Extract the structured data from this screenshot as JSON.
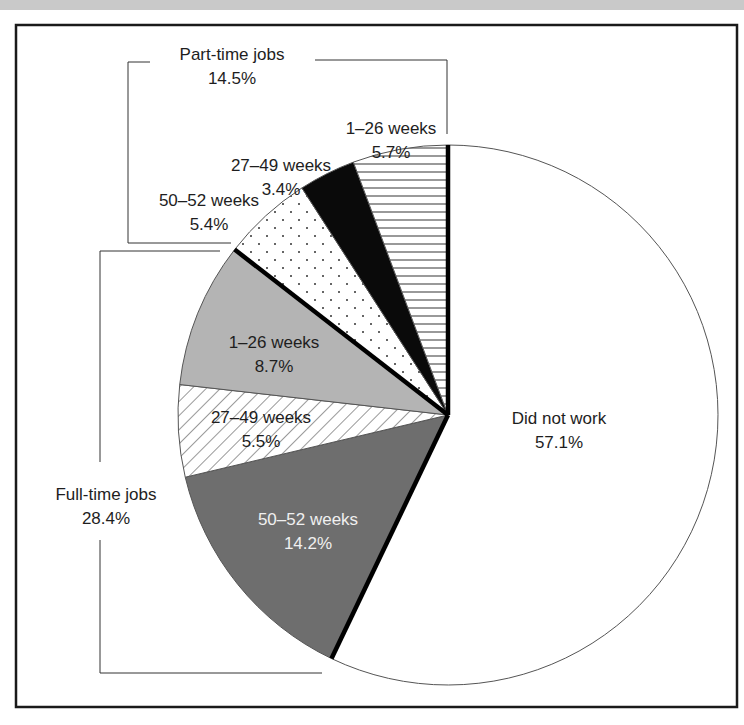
{
  "chart_data": {
    "type": "pie",
    "title": "",
    "start_angle_deg": 0,
    "direction": "clockwise",
    "slices": [
      {
        "id": "did_not_work",
        "group": "Did not work",
        "label": "Did not work",
        "value": 57.1,
        "value_label": "57.1%",
        "fill": "#ffffff",
        "pattern": "none"
      },
      {
        "id": "ft_50_52",
        "group": "Full-time jobs",
        "label": "50–52 weeks",
        "value": 14.2,
        "value_label": "14.2%",
        "fill": "#6e6e6e",
        "pattern": "solid"
      },
      {
        "id": "ft_27_49",
        "group": "Full-time jobs",
        "label": "27–49 weeks",
        "value": 5.5,
        "value_label": "5.5%",
        "fill": "#ffffff",
        "pattern": "diagonal-hatch"
      },
      {
        "id": "ft_1_26",
        "group": "Full-time jobs",
        "label": "1–26 weeks",
        "value": 8.7,
        "value_label": "8.7%",
        "fill": "#b4b4b4",
        "pattern": "solid"
      },
      {
        "id": "pt_50_52",
        "group": "Part-time jobs",
        "label": "50–52 weeks",
        "value": 5.4,
        "value_label": "5.4%",
        "fill": "#ffffff",
        "pattern": "dots"
      },
      {
        "id": "pt_27_49",
        "group": "Part-time jobs",
        "label": "27–49 weeks",
        "value": 3.4,
        "value_label": "3.4%",
        "fill": "#0a0a0a",
        "pattern": "solid"
      },
      {
        "id": "pt_1_26",
        "group": "Part-time jobs",
        "label": "1–26 weeks",
        "value": 5.7,
        "value_label": "5.7%",
        "fill": "#ffffff",
        "pattern": "horizontal-hatch"
      }
    ],
    "groups": [
      {
        "name": "Part-time jobs",
        "total_label": "14.5%",
        "value": 14.5
      },
      {
        "name": "Full-time jobs",
        "total_label": "28.4%",
        "value": 28.4
      }
    ],
    "legend": "none (direct labels with brackets)"
  },
  "labels": {
    "part_time": {
      "title": "Part-time jobs",
      "pct": "14.5%"
    },
    "full_time": {
      "title": "Full-time jobs",
      "pct": "28.4%"
    },
    "pt_1_26": {
      "name": "1–26 weeks",
      "pct": "5.7%"
    },
    "pt_27_49": {
      "name": "27–49 weeks",
      "pct": "3.4%"
    },
    "pt_50_52": {
      "name": "50–52 weeks",
      "pct": "5.4%"
    },
    "ft_1_26": {
      "name": "1–26 weeks",
      "pct": "8.7%"
    },
    "ft_27_49": {
      "name": "27–49 weeks",
      "pct": "5.5%"
    },
    "ft_50_52": {
      "name": "50–52 weeks",
      "pct": "14.2%"
    },
    "did_not_work": {
      "name": "Did not work",
      "pct": "57.1%"
    }
  }
}
